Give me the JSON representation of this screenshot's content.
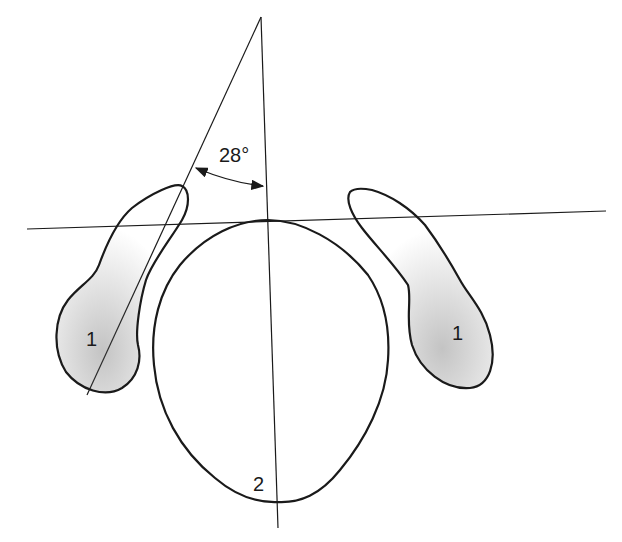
{
  "diagram": {
    "angle_label": "28°",
    "labels": {
      "left_structure": "1",
      "right_structure": "1",
      "center_structure": "2"
    },
    "colors": {
      "stroke": "#1a1a1a",
      "background": "#ffffff"
    }
  }
}
